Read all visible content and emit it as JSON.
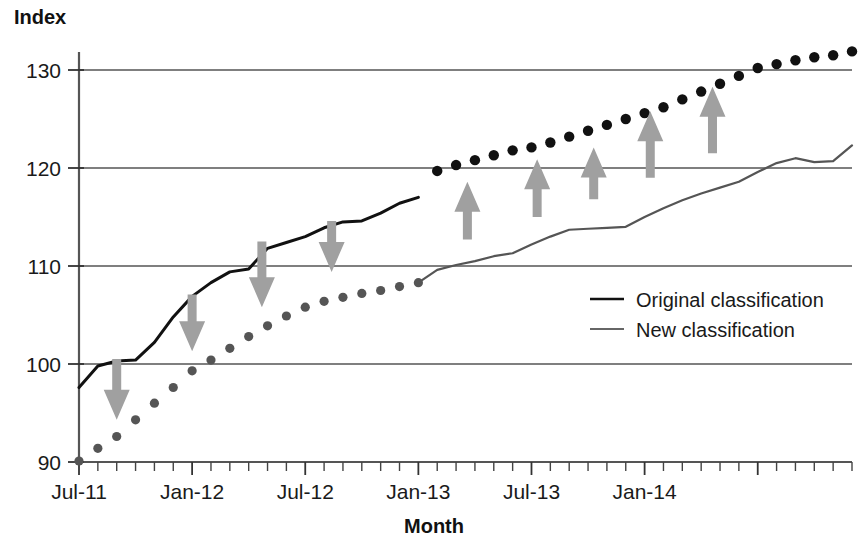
{
  "chart_data": {
    "type": "line",
    "title": "",
    "xlabel": "Month",
    "ylabel": "Index",
    "ylim": [
      90,
      133
    ],
    "xlim": [
      0,
      41
    ],
    "grid": true,
    "legend_position": "center-right",
    "y_ticks": [
      "90",
      "100",
      "110",
      "120",
      "130"
    ],
    "y_tick_values": [
      90,
      100,
      110,
      120,
      130
    ],
    "x_tick_labels": [
      "Jul-11",
      "Jan-12",
      "Jul-12",
      "Jan-13",
      "Jul-13",
      "Jan-14"
    ],
    "x_tick_positions": [
      0,
      6,
      12,
      18,
      24,
      30
    ],
    "x_minor_count": 42,
    "series": [
      {
        "name": "Original classification",
        "style": "solid",
        "color": "#111111",
        "x": [
          0,
          1,
          2,
          3,
          4,
          5,
          6,
          7,
          8,
          9,
          10,
          11,
          12,
          13,
          14,
          15,
          16,
          17,
          18
        ],
        "values": [
          97.6,
          99.8,
          100.3,
          100.4,
          102.2,
          104.8,
          106.9,
          108.3,
          109.4,
          109.7,
          111.8,
          112.4,
          113.0,
          113.9,
          114.5,
          114.6,
          115.4,
          116.4,
          117.0
        ]
      },
      {
        "name": "Original classification (projected)",
        "style": "dotted",
        "color": "#111111",
        "x": [
          19,
          20,
          21,
          22,
          23,
          24,
          25,
          26,
          27,
          28,
          29,
          30,
          31,
          32,
          33,
          34,
          35,
          36,
          37,
          38,
          39,
          40,
          41
        ],
        "values": [
          119.7,
          120.3,
          120.8,
          121.3,
          121.8,
          122.1,
          122.6,
          123.2,
          123.8,
          124.4,
          125.0,
          125.6,
          126.2,
          127.0,
          127.8,
          128.6,
          129.4,
          130.2,
          130.6,
          131.0,
          131.3,
          131.5,
          131.9
        ]
      },
      {
        "name": "New classification (historic)",
        "style": "dotted",
        "color": "#555555",
        "x": [
          0,
          1,
          2,
          3,
          4,
          5,
          6,
          7,
          8,
          9,
          10,
          11,
          12,
          13,
          14,
          15,
          16,
          17,
          18
        ],
        "values": [
          90.1,
          91.4,
          92.6,
          94.3,
          96.0,
          97.6,
          99.3,
          100.4,
          101.6,
          102.8,
          103.9,
          104.9,
          105.8,
          106.4,
          106.8,
          107.2,
          107.5,
          107.9,
          108.3
        ]
      },
      {
        "name": "New classification",
        "style": "solid",
        "color": "#555555",
        "x": [
          18,
          19,
          20,
          21,
          22,
          23,
          24,
          25,
          26,
          27,
          28,
          29,
          30,
          31,
          32,
          33,
          34,
          35,
          36,
          37,
          38,
          39,
          40,
          41
        ],
        "values": [
          108.3,
          109.6,
          110.1,
          110.5,
          111.0,
          111.3,
          112.2,
          113.0,
          113.7,
          113.8,
          113.9,
          114.0,
          115.0,
          115.9,
          116.7,
          117.4,
          118.0,
          118.6,
          119.6,
          120.5,
          121.0,
          120.6,
          120.7,
          122.3
        ]
      }
    ],
    "annotations": {
      "arrow_color": "#a0a0a0",
      "down_arrows": [
        {
          "x": 2.0,
          "y_top": 100.5,
          "y_bottom": 94.3
        },
        {
          "x": 6.0,
          "y_top": 107.1,
          "y_bottom": 101.3
        },
        {
          "x": 9.7,
          "y_top": 112.5,
          "y_bottom": 105.8
        },
        {
          "x": 13.4,
          "y_top": 114.6,
          "y_bottom": 109.4
        }
      ],
      "up_arrows": [
        {
          "x": 20.6,
          "y_top": 118.6,
          "y_bottom": 112.7
        },
        {
          "x": 24.3,
          "y_top": 120.9,
          "y_bottom": 115.0
        },
        {
          "x": 27.3,
          "y_top": 122.1,
          "y_bottom": 116.8
        },
        {
          "x": 30.3,
          "y_top": 125.8,
          "y_bottom": 119.0
        },
        {
          "x": 33.6,
          "y_top": 128.3,
          "y_bottom": 121.5
        }
      ]
    },
    "legend": [
      {
        "label": "Original classification",
        "color": "#111111",
        "width": 2.6
      },
      {
        "label": "New classification",
        "color": "#666666",
        "width": 2.0
      }
    ]
  }
}
